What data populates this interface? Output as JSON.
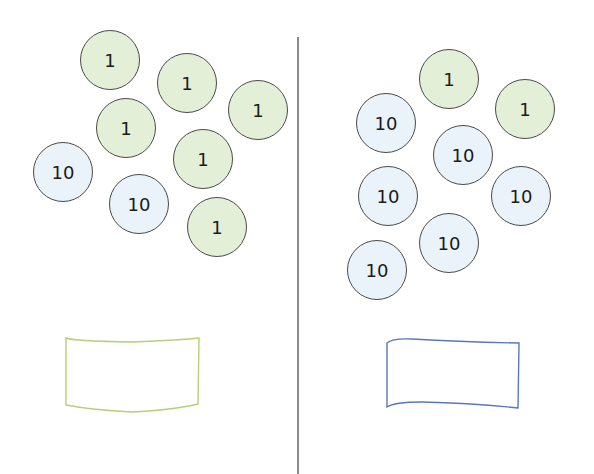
{
  "colors": {
    "ones_fill": "#e3efd6",
    "tens_fill": "#e9f3f9",
    "disc_stroke": "#4a4a4a",
    "divider": "#8a8a8a",
    "left_box_stroke": "#b5cf7a",
    "right_box_stroke": "#5a78b8"
  },
  "left_panel": {
    "discs": [
      {
        "label": "1",
        "type": "one",
        "x": 110,
        "y": 60
      },
      {
        "label": "1",
        "type": "one",
        "x": 187,
        "y": 83
      },
      {
        "label": "1",
        "type": "one",
        "x": 258,
        "y": 110
      },
      {
        "label": "1",
        "type": "one",
        "x": 126,
        "y": 128
      },
      {
        "label": "1",
        "type": "one",
        "x": 203,
        "y": 159
      },
      {
        "label": "10",
        "type": "ten",
        "x": 63,
        "y": 172
      },
      {
        "label": "10",
        "type": "ten",
        "x": 139,
        "y": 204
      },
      {
        "label": "1",
        "type": "one",
        "x": 217,
        "y": 227
      }
    ],
    "answer_box": {
      "value": ""
    }
  },
  "right_panel": {
    "discs": [
      {
        "label": "1",
        "type": "one",
        "x": 449,
        "y": 79
      },
      {
        "label": "1",
        "type": "one",
        "x": 525,
        "y": 109
      },
      {
        "label": "10",
        "type": "ten",
        "x": 386,
        "y": 123
      },
      {
        "label": "10",
        "type": "ten",
        "x": 463,
        "y": 155
      },
      {
        "label": "10",
        "type": "ten",
        "x": 388,
        "y": 196
      },
      {
        "label": "10",
        "type": "ten",
        "x": 521,
        "y": 196
      },
      {
        "label": "10",
        "type": "ten",
        "x": 449,
        "y": 243
      },
      {
        "label": "10",
        "type": "ten",
        "x": 377,
        "y": 270
      }
    ],
    "answer_box": {
      "value": ""
    }
  }
}
